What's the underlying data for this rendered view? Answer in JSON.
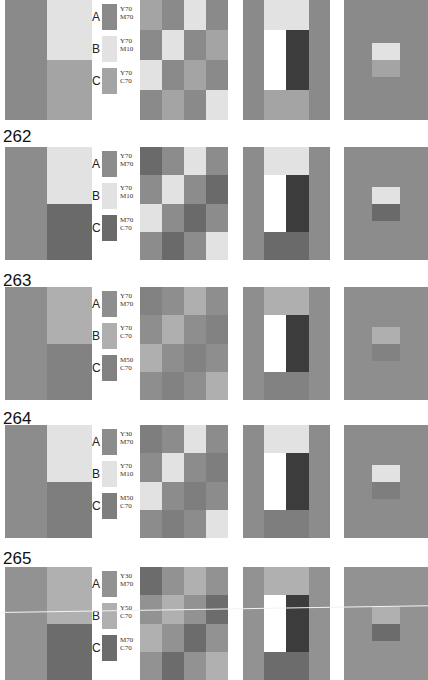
{
  "page": {
    "dark_color": "#3c3c3c",
    "white_color": "#ffffff"
  },
  "rows": [
    {
      "number": "261",
      "top": -16,
      "panel_top": 0,
      "panel_height": 120,
      "colors": {
        "A": "#8a8a8a",
        "B": "#e2e2e2",
        "C": "#a4a4a4"
      },
      "swatches": [
        {
          "letter": "A",
          "code1": "Y70",
          "code2": "M70"
        },
        {
          "letter": "B",
          "code1": "Y70",
          "code2": "M10"
        },
        {
          "letter": "C",
          "code1": "Y70",
          "code2": "C70"
        }
      ]
    },
    {
      "number": "262",
      "top": 128,
      "panel_top": 147,
      "panel_height": 113,
      "colors": {
        "A": "#8c8c8c",
        "B": "#e2e2e2",
        "C": "#6a6a6a"
      },
      "swatches": [
        {
          "letter": "A",
          "code1": "Y70",
          "code2": "M70"
        },
        {
          "letter": "B",
          "code1": "Y70",
          "code2": "M10"
        },
        {
          "letter": "C",
          "code1": "M70",
          "code2": "C70"
        }
      ]
    },
    {
      "number": "263",
      "top": 272,
      "panel_top": 287,
      "panel_height": 113,
      "colors": {
        "A": "#8e8e8e",
        "B": "#afafaf",
        "C": "#828282"
      },
      "swatches": [
        {
          "letter": "A",
          "code1": "Y70",
          "code2": "M70"
        },
        {
          "letter": "B",
          "code1": "Y70",
          "code2": "C70"
        },
        {
          "letter": "C",
          "code1": "M50",
          "code2": "C70"
        }
      ]
    },
    {
      "number": "264",
      "top": 410,
      "panel_top": 425,
      "panel_height": 113,
      "colors": {
        "A": "#8c8c8c",
        "B": "#e2e2e2",
        "C": "#7e7e7e"
      },
      "swatches": [
        {
          "letter": "A",
          "code1": "Y30",
          "code2": "M70"
        },
        {
          "letter": "B",
          "code1": "Y70",
          "code2": "M10"
        },
        {
          "letter": "C",
          "code1": "M50",
          "code2": "C70"
        }
      ]
    },
    {
      "number": "265",
      "top": 550,
      "panel_top": 567,
      "panel_height": 113,
      "colors": {
        "A": "#929292",
        "B": "#b0b0b0",
        "C": "#6c6c6c"
      },
      "swatches": [
        {
          "letter": "A",
          "code1": "Y30",
          "code2": "M70"
        },
        {
          "letter": "B",
          "code1": "Y50",
          "code2": "C70"
        },
        {
          "letter": "C",
          "code1": "M70",
          "code2": "C70"
        }
      ]
    }
  ],
  "grid_pattern": [
    [
      "C",
      "A",
      "B",
      "A"
    ],
    [
      "A",
      "B",
      "A",
      "C"
    ],
    [
      "B",
      "A",
      "C",
      "A"
    ],
    [
      "A",
      "C",
      "A",
      "B"
    ]
  ]
}
